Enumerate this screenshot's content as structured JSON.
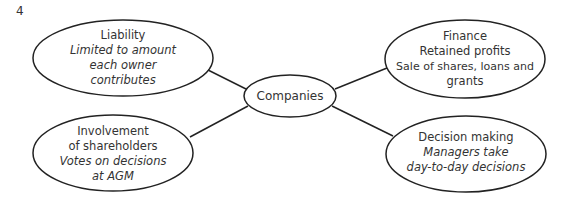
{
  "question_number": "4",
  "diagram": {
    "center": {
      "label": "Companies"
    },
    "nodes": [
      {
        "id": "liability",
        "position": "top-left",
        "lines": [
          {
            "text": "Liability",
            "italic": false
          },
          {
            "text": "Limited to amount",
            "italic": true
          },
          {
            "text": "each owner",
            "italic": true
          },
          {
            "text": "contributes",
            "italic": true
          }
        ]
      },
      {
        "id": "finance",
        "position": "top-right",
        "lines": [
          {
            "text": "Finance",
            "italic": false
          },
          {
            "text": "Retained profits",
            "italic": false
          },
          {
            "text": "Sale of shares, loans and",
            "italic": false
          },
          {
            "text": "grants",
            "italic": false
          }
        ]
      },
      {
        "id": "involvement",
        "position": "bottom-left",
        "lines": [
          {
            "text": "Involvement",
            "italic": false
          },
          {
            "text": "of shareholders",
            "italic": false
          },
          {
            "text": "Votes on decisions",
            "italic": true
          },
          {
            "text": "at AGM",
            "italic": true
          }
        ]
      },
      {
        "id": "decision",
        "position": "bottom-right",
        "lines": [
          {
            "text": "Decision making",
            "italic": false
          },
          {
            "text": "Managers take",
            "italic": true
          },
          {
            "text": "day-to-day decisions",
            "italic": true
          }
        ]
      }
    ],
    "colors": {
      "stroke": "#222222",
      "text": "#333333",
      "background": "#ffffff"
    }
  }
}
